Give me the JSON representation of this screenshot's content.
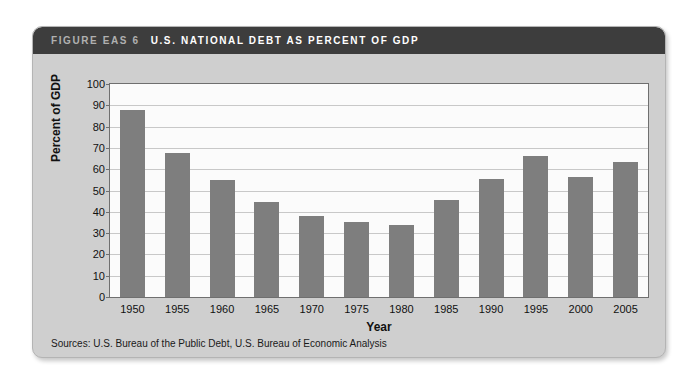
{
  "figure": {
    "number_label": "FIGURE EAS 6",
    "title": "U.S. NATIONAL DEBT AS PERCENT OF GDP",
    "source_note": "Sources: U.S. Bureau of the Public Debt, U.S. Bureau of Economic Analysis",
    "colors": {
      "title_bar": "#3d3d3d",
      "card_background": "#cfcfcf",
      "bar": "#7e7e7e",
      "plot_background": "#fbfbfb",
      "gridline": "#c8c8c8"
    }
  },
  "chart_data": {
    "type": "bar",
    "title": "U.S. NATIONAL DEBT AS PERCENT OF GDP",
    "xlabel": "Year",
    "ylabel": "Percent of GDP",
    "categories": [
      "1950",
      "1955",
      "1960",
      "1965",
      "1970",
      "1975",
      "1980",
      "1985",
      "1990",
      "1995",
      "2000",
      "2005"
    ],
    "values": [
      88,
      67.5,
      55,
      44.5,
      38,
      35,
      34,
      45.5,
      55.5,
      66,
      56.5,
      63.5
    ],
    "ylim": [
      0,
      100
    ],
    "yticks": [
      0,
      10,
      20,
      30,
      40,
      50,
      60,
      70,
      80,
      90,
      100
    ],
    "ytick_labels": [
      "0",
      "10",
      "20",
      "30",
      "40",
      "50",
      "60",
      "70",
      "80",
      "90",
      "100"
    ],
    "grid": true,
    "legend": null
  }
}
